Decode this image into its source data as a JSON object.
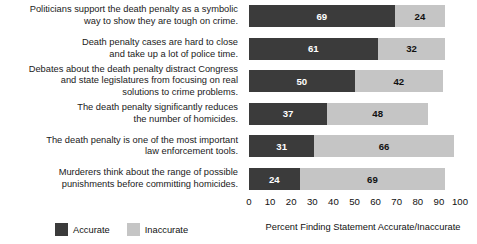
{
  "chart_data": {
    "type": "bar",
    "orientation": "horizontal",
    "stacked": true,
    "title": "",
    "xlabel": "Percent Finding Statement Accurate/Inaccurate",
    "ylabel": "",
    "xlim": [
      0,
      100
    ],
    "xticks": [
      0,
      10,
      20,
      30,
      40,
      50,
      60,
      70,
      80,
      90,
      100
    ],
    "grid": false,
    "legend_position": "bottom-left",
    "categories": [
      "Politicians support the death penalty as a symbolic\nway to show they are tough on crime.",
      "Death penalty cases are hard to close\nand take up a lot of police time.",
      "Debates about the death penalty distract Congress\nand state legislatures from focusing on real\nsolutions to crime problems.",
      "The death penalty significantly reduces\nthe number of homicides.",
      "The death penalty is one of the most important\nlaw enforcement tools.",
      "Murderers think about the range of possible\npunishments before committing homicides."
    ],
    "series": [
      {
        "name": "Accurate",
        "color": "#3b3b3b",
        "values": [
          69,
          61,
          50,
          37,
          31,
          24
        ]
      },
      {
        "name": "Inaccurate",
        "color": "#c5c5c5",
        "values": [
          24,
          32,
          42,
          48,
          66,
          69
        ]
      }
    ]
  },
  "legend": {
    "items": [
      {
        "label": "Accurate",
        "swatch": "accurate"
      },
      {
        "label": "Inaccurate",
        "swatch": "inaccurate"
      }
    ]
  }
}
